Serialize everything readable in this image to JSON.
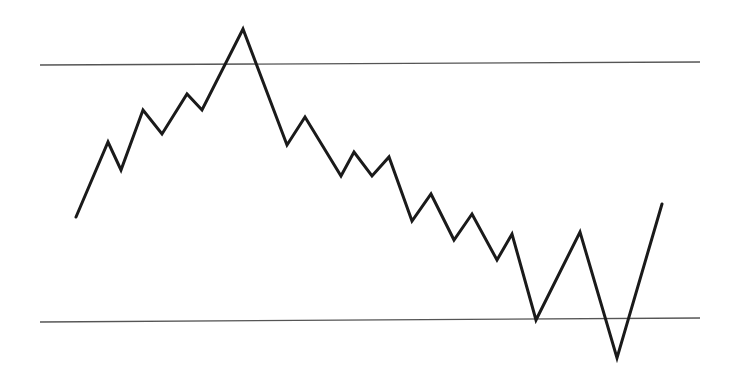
{
  "chart_data": {
    "type": "line",
    "title": "",
    "xlabel": "",
    "ylabel": "",
    "grid": false,
    "legend": null,
    "axes_visible": false,
    "coordinate_space": "pixel",
    "canvas": {
      "width": 737,
      "height": 384
    },
    "series": [
      {
        "name": "price",
        "color": "#1a1a1a",
        "stroke_width": 3,
        "points": [
          [
            76,
            217
          ],
          [
            108,
            142
          ],
          [
            121,
            170
          ],
          [
            143,
            110
          ],
          [
            162,
            134
          ],
          [
            187,
            94
          ],
          [
            202,
            110
          ],
          [
            243,
            29
          ],
          [
            287,
            145
          ],
          [
            305,
            117
          ],
          [
            341,
            176
          ],
          [
            354,
            152
          ],
          [
            372,
            176
          ],
          [
            389,
            157
          ],
          [
            412,
            221
          ],
          [
            431,
            194
          ],
          [
            454,
            240
          ],
          [
            472,
            214
          ],
          [
            497,
            260
          ],
          [
            512,
            234
          ],
          [
            536,
            320
          ],
          [
            580,
            232
          ],
          [
            617,
            358
          ],
          [
            662,
            204
          ]
        ]
      }
    ],
    "reference_lines": [
      {
        "name": "upper-horizontal-line",
        "role": "resistance",
        "color": "#555555",
        "stroke_width": 1.3,
        "x1": 40,
        "y1": 65,
        "x2": 700,
        "y2": 62
      },
      {
        "name": "lower-horizontal-line",
        "role": "support",
        "color": "#555555",
        "stroke_width": 1.3,
        "x1": 40,
        "y1": 322,
        "x2": 700,
        "y2": 318
      }
    ]
  }
}
